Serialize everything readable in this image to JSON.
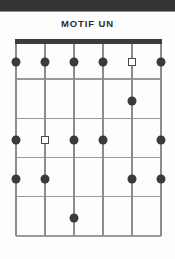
{
  "page": {
    "title": "MOTIF UN",
    "background_color": "#fdfdfd",
    "scan_band_color": "#333234"
  },
  "diagram": {
    "type": "guitar-fretboard",
    "string_count": 6,
    "fret_count": 5,
    "nut_color": "#3b3a3c",
    "grid_line_color": "#8c8c8e",
    "filled_marker_color": "#3a393b",
    "open_marker_color": "#4a494b",
    "string_x": [
      0,
      29,
      58,
      87,
      116,
      145
    ],
    "fret_y": [
      0,
      39.25,
      78.5,
      117.75,
      157,
      196.25
    ],
    "row_center_y": [
      23,
      62,
      101,
      140,
      179
    ],
    "markers": [
      {
        "row": 1,
        "string": 1,
        "shape": "filled-circle"
      },
      {
        "row": 1,
        "string": 2,
        "shape": "filled-circle"
      },
      {
        "row": 1,
        "string": 3,
        "shape": "filled-circle"
      },
      {
        "row": 1,
        "string": 4,
        "shape": "filled-circle"
      },
      {
        "row": 1,
        "string": 5,
        "shape": "open-square"
      },
      {
        "row": 1,
        "string": 6,
        "shape": "filled-circle"
      },
      {
        "row": 2,
        "string": 5,
        "shape": "filled-circle"
      },
      {
        "row": 3,
        "string": 1,
        "shape": "filled-circle"
      },
      {
        "row": 3,
        "string": 2,
        "shape": "open-square"
      },
      {
        "row": 3,
        "string": 3,
        "shape": "filled-circle"
      },
      {
        "row": 3,
        "string": 4,
        "shape": "filled-circle"
      },
      {
        "row": 3,
        "string": 6,
        "shape": "filled-circle"
      },
      {
        "row": 4,
        "string": 1,
        "shape": "filled-circle"
      },
      {
        "row": 4,
        "string": 2,
        "shape": "filled-circle"
      },
      {
        "row": 4,
        "string": 5,
        "shape": "filled-circle"
      },
      {
        "row": 4,
        "string": 6,
        "shape": "filled-circle"
      },
      {
        "row": 5,
        "string": 3,
        "shape": "filled-circle"
      }
    ]
  }
}
